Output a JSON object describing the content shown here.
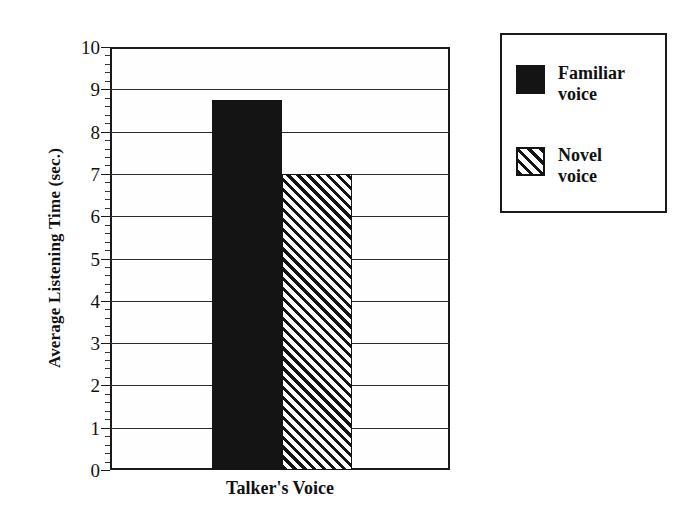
{
  "chart_data": {
    "type": "bar",
    "title": "",
    "subtitle": "",
    "xlabel": "Talker's Voice",
    "ylabel": "Average Listening Time (sec.)",
    "categories": [
      "Talker's Voice"
    ],
    "series": [
      {
        "name": "Familiar voice",
        "values": [
          8.75
        ],
        "fill": "solid-black",
        "color": "#141414"
      },
      {
        "name": "Novel voice",
        "values": [
          7.0
        ],
        "fill": "diagonal-hatch",
        "color": "#141414"
      }
    ],
    "ylim": [
      0,
      10
    ],
    "ytick_labels": [
      "0",
      "1",
      "2",
      "3",
      "4",
      "5",
      "6",
      "7",
      "8",
      "9",
      "10"
    ],
    "ytick_values": [
      0,
      1,
      2,
      3,
      4,
      5,
      6,
      7,
      8,
      9,
      10
    ],
    "minor_tick_interval": 0.2,
    "grid": "horizontal",
    "legend_position": "right-outside",
    "legend_entries": [
      "Familiar\nvoice",
      "Novel\nvoice"
    ]
  },
  "axes": {
    "y_title": "Average Listening Time (sec.)",
    "x_title": "Talker's Voice"
  },
  "legend": {
    "items": [
      {
        "label": "Familiar\nvoice",
        "swatch": "solid-black-swatch"
      },
      {
        "label": "Novel\nvoice",
        "swatch": "diagonal-hatch-swatch"
      }
    ]
  }
}
